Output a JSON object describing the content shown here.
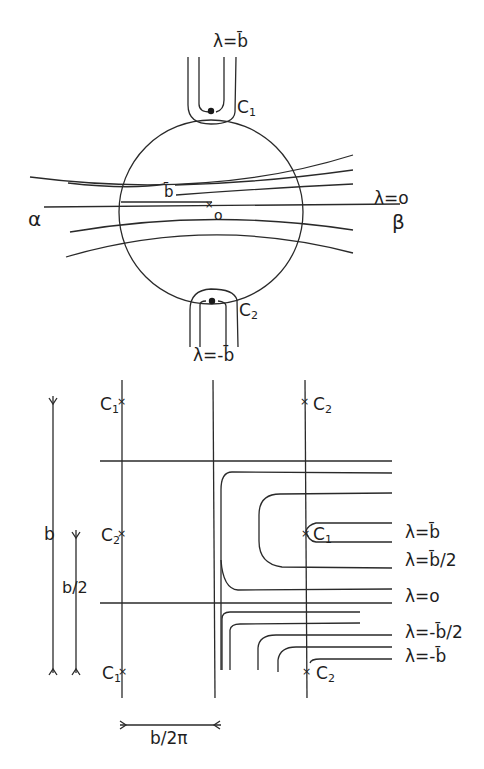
{
  "top_figure": {
    "name": "circle-mapping",
    "labels": {
      "lambda_b_top": "λ=b̄",
      "c1": "C",
      "c1_sub": "1",
      "c2": "C",
      "c2_sub": "2",
      "b_radius": "b̄",
      "origin": "o",
      "lambda_zero": "λ=o",
      "alpha": "α",
      "beta": "β",
      "lambda_neg_b_bottom": "λ=-b̄"
    }
  },
  "bottom_figure": {
    "name": "strip-mapping",
    "labels": {
      "c1_top": "C",
      "c1_top_sub": "1",
      "c2_top": "C",
      "c2_top_sub": "2",
      "c2_mid": "C",
      "c2_mid_sub": "2",
      "c1_mid": "C",
      "c1_mid_sub": "1",
      "c1_bot": "C",
      "c1_bot_sub": "1",
      "c2_bot": "C",
      "c2_bot_sub": "2",
      "b_span": "b",
      "b_half": "b/2",
      "period": "b/2π"
    },
    "lambda_levels": [
      "λ=b̄",
      "λ=b̄/2",
      "λ=o",
      "λ=-b̄/2",
      "λ=-b̄"
    ]
  }
}
